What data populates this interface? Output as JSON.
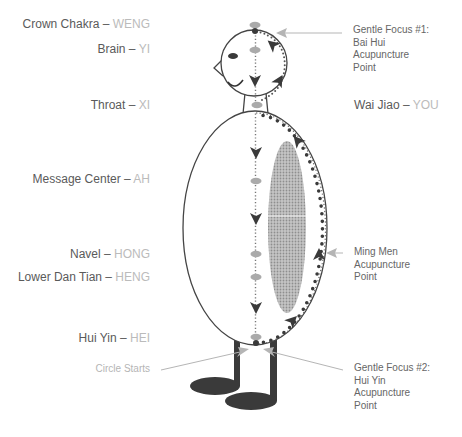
{
  "diagram": {
    "left_labels": [
      {
        "name": "Crown Chakra",
        "separator": " – ",
        "sound": "WENG"
      },
      {
        "name": "Brain",
        "separator": " – ",
        "sound": "YI"
      },
      {
        "name": "Throat",
        "separator": " – ",
        "sound": "XI"
      },
      {
        "name": "Message Center",
        "separator": " – ",
        "sound": "AH"
      },
      {
        "name": "Navel",
        "separator": " – ",
        "sound": "HONG"
      },
      {
        "name": "Lower Dan Tian",
        "separator": " – ",
        "sound": "HENG"
      },
      {
        "name": "Hui Yin",
        "separator": " – ",
        "sound": "HEI"
      }
    ],
    "circle_starts_label": "Circle Starts",
    "bai_hui_label": [
      "Gentle Focus #1:",
      "Bai Hui",
      "Acupuncture",
      "Point"
    ],
    "wai_jiao_label": {
      "name": "Wai Jiao",
      "separator": " – ",
      "sound": "YOU"
    },
    "ming_men_label": [
      "Ming Men",
      "Acupuncture",
      "Point"
    ],
    "hui_yin_focus_label": [
      "Gentle Focus #2:",
      "Hui Yin",
      "Acupuncture",
      "Point"
    ],
    "icons": {
      "center_flow_arrows": "arrowhead-down-icon",
      "orbit_arrows": "arrowhead-icon",
      "pointer_arrows": "pointer-arrow-icon"
    }
  },
  "colors": {
    "label_text": "#5a5a5a",
    "sound_text": "#bbbbbb",
    "annotation_text": "#666666",
    "circle_starts_text": "#b5b5b5",
    "outline": "#444444",
    "dark_fill": "#3a3a3a",
    "point_marker": "#aaaaaa",
    "pointer_line": "#b5b5b5",
    "stipple": "#b8b8b8"
  }
}
